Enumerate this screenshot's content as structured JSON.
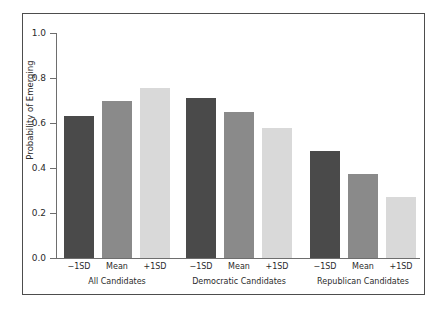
{
  "chart_data": {
    "type": "bar",
    "title": "",
    "xlabel": "",
    "ylabel": "Probability of Emerging",
    "ylim": [
      0.0,
      1.0
    ],
    "ytick_labels": [
      "0.0",
      "0.2",
      "0.4",
      "0.6",
      "0.8",
      "1.0"
    ],
    "ytick_values": [
      0.0,
      0.2,
      0.4,
      0.6,
      0.8,
      1.0
    ],
    "grid": false,
    "legend": "none",
    "categories": [
      "−1SD",
      "Mean",
      "+1SD"
    ],
    "groups": [
      {
        "label": "All Candidates",
        "bars": [
          {
            "category": "−1SD",
            "value": 0.63,
            "color": "#4a4a4a"
          },
          {
            "category": "Mean",
            "value": 0.7,
            "color": "#8a8a8a"
          },
          {
            "category": "+1SD",
            "value": 0.755,
            "color": "#d9d9d9"
          }
        ]
      },
      {
        "label": "Democratic Candidates",
        "bars": [
          {
            "category": "−1SD",
            "value": 0.71,
            "color": "#4a4a4a"
          },
          {
            "category": "Mean",
            "value": 0.65,
            "color": "#8a8a8a"
          },
          {
            "category": "+1SD",
            "value": 0.58,
            "color": "#d9d9d9"
          }
        ]
      },
      {
        "label": "Republican Candidates",
        "bars": [
          {
            "category": "−1SD",
            "value": 0.475,
            "color": "#4a4a4a"
          },
          {
            "category": "Mean",
            "value": 0.375,
            "color": "#8a8a8a"
          },
          {
            "category": "+1SD",
            "value": 0.27,
            "color": "#d9d9d9"
          }
        ]
      }
    ]
  },
  "style": {
    "background": "#ffffff",
    "frame_color": "#4d4d4d",
    "axis_color": "#6e6e6e",
    "text_color": "#2b2b2b"
  }
}
